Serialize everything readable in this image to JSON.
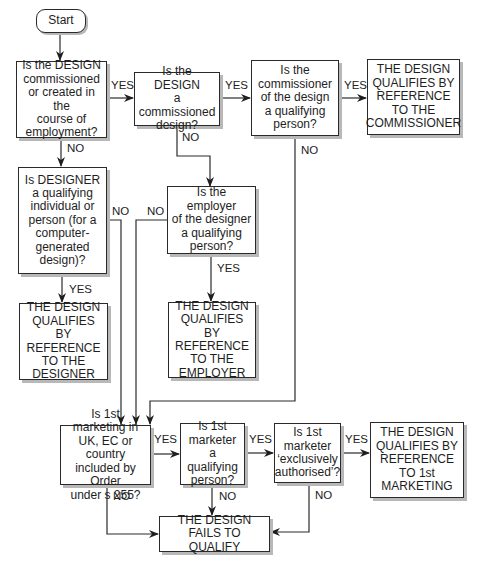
{
  "nodes": {
    "start": "Start",
    "q_commissioned_or_employment": "Is the DESIGN\ncommissioned\nor created in the\ncourse of\nemployment?",
    "q_commissioned": "Is the DESIGN\na commissioned\ndesign?",
    "q_commissioner_qualifying": "Is the\ncommissioner\nof the design\na qualifying\nperson?",
    "r_commissioner": "THE DESIGN\nQUALIFIES BY\nREFERENCE\nTO THE\nCOMMISSIONER",
    "q_designer_qualifying": "Is DESIGNER\na qualifying\nindividual or\nperson (for a\ncomputer-\ngenerated\ndesign)?",
    "q_employer_qualifying": "Is the employer\nof the designer\na qualifying\nperson?",
    "r_designer": "THE DESIGN\nQUALIFIES BY\nREFERENCE\nTO THE\nDESIGNER",
    "r_employer": "THE DESIGN\nQUALIFIES BY\nREFERENCE\nTO THE\nEMPLOYER",
    "q_first_marketing": "Is 1st marketing in\nUK, EC or country\nincluded by Order\nunder s 255?",
    "q_marketer_qualifying": "Is 1st\nmarketer a\nqualifying\nperson?",
    "q_exclusively_authorised": "Is 1st\nmarketer\n‘exclusively\nauthorised’?",
    "r_first_marketing": "THE DESIGN\nQUALIFIES BY\nREFERENCE\nTO 1st\nMARKETING",
    "r_fails": "THE DESIGN\nFAILS TO QUALIFY"
  },
  "edge_labels": {
    "yes1": "YES",
    "yes2": "YES",
    "yes3": "YES",
    "no1": "NO",
    "no2": "NO",
    "no3": "NO",
    "no4": "NO",
    "no5": "NO",
    "yes4": "YES",
    "yes5": "YES",
    "yes6": "YES",
    "yes7": "YES",
    "no6": "NO",
    "no7": "NO",
    "no8": "NO"
  },
  "colors": {
    "line": "#2a2a2a",
    "shadow": "#b8b8b8"
  }
}
